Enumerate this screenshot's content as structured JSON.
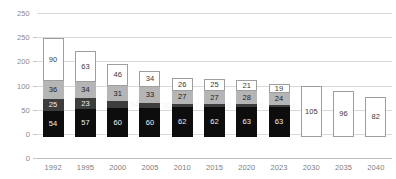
{
  "chart_data": {
    "type": "bar",
    "title": "",
    "subtitle": "",
    "xlabel": "",
    "ylabel": "",
    "stacked": true,
    "grid": true,
    "legend_position": "none",
    "ylim": [
      0,
      300
    ],
    "yticks": [
      300,
      250,
      200,
      150,
      100,
      50,
      0
    ],
    "ytick_labels": [
      "250",
      "250",
      "200",
      "100",
      "50",
      "0"
    ],
    "ytick_values": [
      300,
      250,
      200,
      150,
      100,
      50,
      0
    ],
    "categories": [
      "1992",
      "1995",
      "2000",
      "2005",
      "2010",
      "2015",
      "2020",
      "2023",
      "2030",
      "2035",
      "2040"
    ],
    "series": [
      {
        "name": "segment-1",
        "color": "#0d0d0d",
        "values": [
          54,
          57,
          60,
          60,
          62,
          62,
          63,
          63,
          null,
          null,
          null
        ]
      },
      {
        "name": "segment-2",
        "color": "#3d3d3d",
        "values": [
          25,
          23,
          14,
          10,
          7,
          6,
          5,
          4,
          null,
          null,
          null
        ]
      },
      {
        "name": "segment-3",
        "color": "#b5b5b5",
        "values": [
          36,
          34,
          31,
          33,
          27,
          27,
          28,
          24,
          null,
          null,
          null
        ]
      },
      {
        "name": "segment-4",
        "color": "#ffffff",
        "values": [
          90,
          63,
          46,
          34,
          26,
          25,
          21,
          19,
          105,
          96,
          82
        ]
      }
    ],
    "totals": [
      205,
      177,
      151,
      137,
      122,
      120,
      117,
      110,
      105,
      96,
      82
    ]
  },
  "axis": {
    "y_labels": [
      "250",
      "250",
      "200",
      "100",
      "50",
      "0"
    ],
    "x_labels": [
      "1992",
      "1995",
      "2000",
      "2005",
      "2010",
      "2015",
      "2020",
      "2023",
      "2030",
      "2035",
      "2040"
    ]
  },
  "colors": {
    "segment_1": "#0d0d0d",
    "segment_2": "#3d3d3d",
    "segment_3": "#b5b5b5",
    "segment_4": "#ffffff",
    "gridline": "#d9d9d9",
    "axis_text": "#8a8a8a"
  }
}
